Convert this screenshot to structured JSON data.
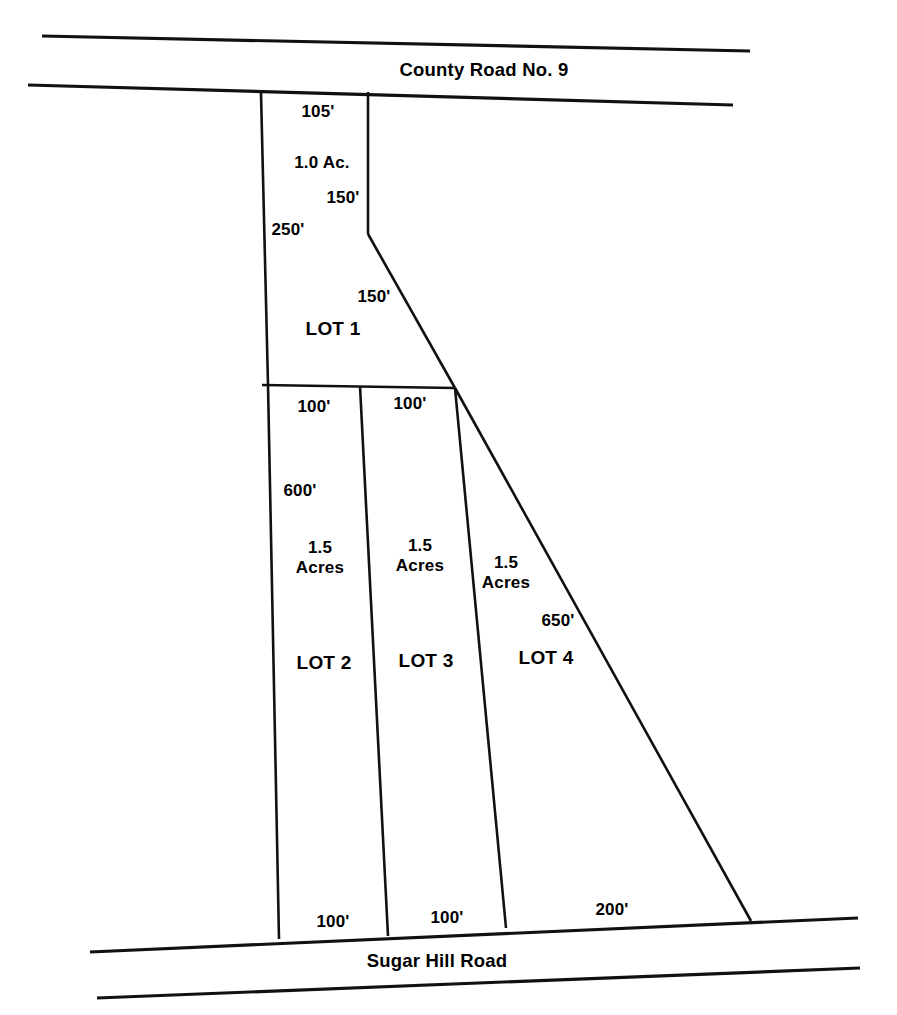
{
  "document": {
    "type": "plat-map",
    "title": "Subdivision Plat",
    "ink_color": "#111111",
    "background_color": "#ffffff"
  },
  "roads": [
    {
      "name": "county-road-no-9",
      "label": "County Road No. 9",
      "position": "top",
      "label_x": 484,
      "label_y": 70
    },
    {
      "name": "sugar-hill-road",
      "label": "Sugar Hill Road",
      "position": "bottom",
      "label_x": 437,
      "label_y": 961
    }
  ],
  "lots": [
    {
      "id": "lot-1",
      "label": "LOT 1",
      "label_x": 333,
      "label_y": 329,
      "area": "1.0 Ac.",
      "area_x": 322,
      "area_y": 163,
      "area_lines": [
        "1.0 Ac."
      ],
      "dimensions": [
        {
          "name": "lot-1-frontage",
          "text": "105'",
          "x": 318,
          "y": 112
        },
        {
          "name": "lot-1-east-upper",
          "text": "150'",
          "x": 343,
          "y": 198
        },
        {
          "name": "lot-1-west",
          "text": "250'",
          "x": 288,
          "y": 230
        },
        {
          "name": "lot-1-southeast",
          "text": "150'",
          "x": 374,
          "y": 297
        }
      ]
    },
    {
      "id": "lot-2",
      "label": "LOT 2",
      "label_x": 324,
      "label_y": 663,
      "area_lines": [
        "1.5",
        "Acres"
      ],
      "area_x": 320,
      "area_y": 558,
      "dimensions": [
        {
          "name": "lot-2-north",
          "text": "100'",
          "x": 314,
          "y": 407
        },
        {
          "name": "lot-2-west",
          "text": "600'",
          "x": 300,
          "y": 491
        },
        {
          "name": "lot-2-south",
          "text": "100'",
          "x": 333,
          "y": 922
        }
      ]
    },
    {
      "id": "lot-3",
      "label": "LOT 3",
      "label_x": 426,
      "label_y": 661,
      "area_lines": [
        "1.5",
        "Acres"
      ],
      "area_x": 420,
      "area_y": 556,
      "dimensions": [
        {
          "name": "lot-3-north",
          "text": "100'",
          "x": 410,
          "y": 404
        },
        {
          "name": "lot-3-south",
          "text": "100'",
          "x": 447,
          "y": 918
        }
      ]
    },
    {
      "id": "lot-4",
      "label": "LOT 4",
      "label_x": 546,
      "label_y": 658,
      "area_lines": [
        "1.5",
        "Acres"
      ],
      "area_x": 506,
      "area_y": 573,
      "dimensions": [
        {
          "name": "lot-4-east",
          "text": "650'",
          "x": 558,
          "y": 621
        },
        {
          "name": "lot-4-south",
          "text": "200'",
          "x": 612,
          "y": 910
        }
      ]
    }
  ],
  "geometry": {
    "county_road_upper": "M 42,36 L 750,51",
    "county_road_lower": "M 28,85 L 733,105",
    "sugar_hill_upper": "M 90,952 L 858,918",
    "sugar_hill_lower": "M 97,998 L 860,968",
    "west_boundary": "M 261,93 L 268,385 L 279,939",
    "lot1_east_upper": "M 368,92 L 368,234",
    "lot1_east_diagonal": "M 368,234 L 455,388",
    "lot1_south": "M 262,385 L 455,388",
    "lot2_lot3_divider": "M 360,386 L 388,936",
    "lot3_lot4_divider": "M 455,388 L 506,928",
    "east_boundary": "M 455,388 L 751,921"
  }
}
